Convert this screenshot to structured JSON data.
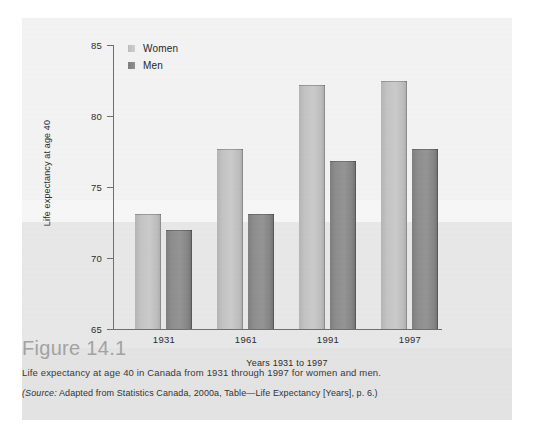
{
  "figure": {
    "heading": "Figure 14.1",
    "caption": "Life expectancy at age 40 in Canada from 1931 through 1997 for women and men.",
    "source_prefix": "(Source:",
    "source_rest": " Adapted from Statistics Canada, 2000a, Table—Life Expectancy [Years], p. 6.)"
  },
  "legend": {
    "items": [
      {
        "label": "Women",
        "color": "#c3c3c3"
      },
      {
        "label": "Men",
        "color": "#8a8a8a"
      }
    ]
  },
  "axes": {
    "y_ticks": [
      "85",
      "80",
      "75",
      "70",
      "65"
    ],
    "x_ticks": [
      "1931",
      "1961",
      "1991",
      "1997"
    ]
  },
  "chart_data": {
    "type": "bar",
    "title": "",
    "xlabel": "Years 1931 to 1997",
    "ylabel": "Life expectancy at age 40",
    "categories": [
      "1931",
      "1961",
      "1991",
      "1997"
    ],
    "series": [
      {
        "name": "Women",
        "color": "#c3c3c3",
        "values": [
          73.1,
          77.7,
          82.2,
          82.5
        ]
      },
      {
        "name": "Men",
        "color": "#8a8a8a",
        "values": [
          72.0,
          73.1,
          76.8,
          77.7
        ]
      }
    ],
    "ylim": [
      65,
      85
    ],
    "ytick_values": [
      65,
      70,
      75,
      80,
      85
    ],
    "grid": false,
    "legend_position": "top-left"
  }
}
